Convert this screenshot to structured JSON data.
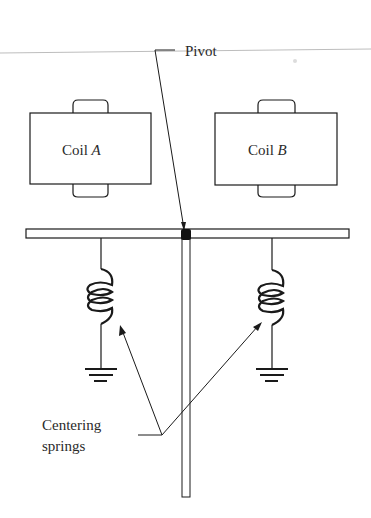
{
  "diagram": {
    "type": "electromechanical-schematic",
    "labels": {
      "pivot": "Pivot",
      "coil_a_prefix": "Coil ",
      "coil_a_letter": "A",
      "coil_b_prefix": "Coil ",
      "coil_b_letter": "B",
      "springs_line1": "Centering",
      "springs_line2": "springs"
    },
    "components": [
      {
        "id": "coil-a",
        "kind": "coil",
        "label": "Coil A"
      },
      {
        "id": "coil-b",
        "kind": "coil",
        "label": "Coil B"
      },
      {
        "id": "pivot",
        "kind": "pivot-point",
        "label": "Pivot"
      },
      {
        "id": "beam",
        "kind": "horizontal-bar"
      },
      {
        "id": "pointer",
        "kind": "vertical-rod"
      },
      {
        "id": "spring-left",
        "kind": "spring",
        "grounded": true
      },
      {
        "id": "spring-right",
        "kind": "spring",
        "grounded": true
      }
    ],
    "colors": {
      "ink": "#1a1a1a",
      "scan_line": "#b8b8b8",
      "background": "#ffffff"
    }
  }
}
